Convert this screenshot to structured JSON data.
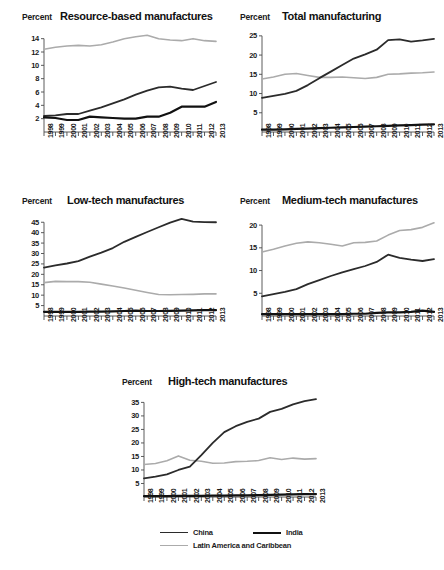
{
  "legend": {
    "items": [
      {
        "name": "China",
        "color": "#2b2b2b",
        "width": 1.9
      },
      {
        "name": "India",
        "color": "#111111",
        "width": 2.6
      },
      {
        "name": "Latin America and Caribbean",
        "color": "#ababab",
        "width": 1.7
      }
    ]
  },
  "axis_unit_label": "Percent",
  "chart_data": [
    {
      "type": "line",
      "title": "Resource-based manufactures",
      "xlabel": "",
      "ylabel": "Percent",
      "ylim": [
        0,
        15
      ],
      "yticks": [
        2,
        4,
        6,
        8,
        10,
        12,
        14
      ],
      "ytick_labels": [
        "2",
        "4",
        "6",
        "8",
        "10",
        "12",
        "14"
      ],
      "grid": false,
      "legend_position": "bottom",
      "categories": [
        "1998",
        "1999",
        "2000",
        "2001",
        "2002",
        "2003",
        "2004",
        "2005",
        "2006",
        "2007",
        "2008",
        "2009",
        "2010",
        "2011",
        "2012",
        "2013"
      ],
      "series": [
        {
          "name": "China",
          "color": "#2b2b2b",
          "values": [
            2.4,
            2.5,
            2.7,
            2.7,
            3.2,
            3.7,
            4.3,
            4.9,
            5.6,
            6.2,
            6.7,
            6.8,
            6.5,
            6.3,
            6.9,
            7.5
          ]
        },
        {
          "name": "India",
          "color": "#111111",
          "values": [
            2.2,
            2.1,
            1.8,
            1.8,
            2.3,
            2.2,
            2.1,
            2.0,
            2.0,
            2.3,
            2.3,
            2.9,
            3.8,
            3.8,
            3.8,
            4.5
          ]
        },
        {
          "name": "Latin America and Caribbean",
          "color": "#ababab",
          "values": [
            12.4,
            12.7,
            12.9,
            13.0,
            12.9,
            13.1,
            13.5,
            14.0,
            14.3,
            14.5,
            14.0,
            13.8,
            13.7,
            14.0,
            13.7,
            13.6
          ]
        }
      ]
    },
    {
      "type": "line",
      "title": "Total manufacturing",
      "xlabel": "",
      "ylabel": "Percent",
      "ylim": [
        0,
        26
      ],
      "yticks": [
        5,
        10,
        15,
        20,
        25
      ],
      "ytick_labels": [
        "5",
        "10",
        "15",
        "20",
        "25"
      ],
      "grid": false,
      "legend_position": "bottom",
      "categories": [
        "1998",
        "1999",
        "2000",
        "2001",
        "2002",
        "2003",
        "2004",
        "2005",
        "2006",
        "2007",
        "2008",
        "2009",
        "2010",
        "2011",
        "2012",
        "2013"
      ],
      "series": [
        {
          "name": "China",
          "color": "#2b2b2b",
          "values": [
            8.9,
            9.4,
            9.9,
            10.7,
            12.2,
            14.0,
            15.7,
            17.4,
            19.1,
            20.2,
            21.4,
            23.9,
            24.1,
            23.5,
            23.8,
            24.2
          ]
        },
        {
          "name": "India",
          "color": "#111111",
          "values": [
            0.6,
            0.6,
            0.7,
            0.8,
            0.9,
            1.0,
            1.1,
            1.2,
            1.3,
            1.4,
            1.5,
            1.6,
            1.7,
            1.8,
            1.9,
            2.0
          ]
        },
        {
          "name": "Latin America and Caribbean",
          "color": "#ababab",
          "values": [
            13.8,
            14.3,
            15.0,
            15.2,
            14.7,
            14.2,
            14.2,
            14.3,
            14.1,
            13.9,
            14.2,
            15.0,
            15.1,
            15.3,
            15.4,
            15.6
          ]
        }
      ]
    },
    {
      "type": "line",
      "title": "Low-tech manufactures",
      "xlabel": "",
      "ylabel": "Percent",
      "ylim": [
        0,
        48
      ],
      "yticks": [
        5,
        10,
        15,
        20,
        25,
        30,
        35,
        40,
        45
      ],
      "ytick_labels": [
        "5",
        "10",
        "15",
        "20",
        "25",
        "30",
        "35",
        "40",
        "45"
      ],
      "grid": false,
      "legend_position": "bottom",
      "categories": [
        "1998",
        "1999",
        "2000",
        "2001",
        "2002",
        "2003",
        "2004",
        "2005",
        "2006",
        "2007",
        "2008",
        "2009",
        "2010",
        "2011",
        "2012",
        "2013"
      ],
      "series": [
        {
          "name": "China",
          "color": "#2b2b2b",
          "values": [
            23.2,
            24.3,
            25.2,
            26.3,
            28.5,
            30.4,
            32.6,
            35.6,
            38.0,
            40.3,
            42.6,
            44.8,
            46.6,
            45.3,
            45.1,
            45.0
          ]
        },
        {
          "name": "India",
          "color": "#111111",
          "values": [
            2.0,
            2.0,
            2.0,
            2.0,
            2.1,
            2.1,
            2.2,
            2.4,
            2.6,
            2.4,
            2.4,
            2.5,
            2.6,
            2.7,
            2.8,
            2.8
          ]
        },
        {
          "name": "Latin America and Caribbean",
          "color": "#ababab",
          "values": [
            16.0,
            16.6,
            16.5,
            16.5,
            16.2,
            15.3,
            14.4,
            13.4,
            12.4,
            11.3,
            10.3,
            10.2,
            10.3,
            10.4,
            10.6,
            10.6
          ]
        }
      ]
    },
    {
      "type": "line",
      "title": "Medium-tech manufactures",
      "xlabel": "",
      "ylabel": "Percent",
      "ylim": [
        0,
        22
      ],
      "yticks": [
        5,
        10,
        15,
        20
      ],
      "ytick_labels": [
        "5",
        "10",
        "15",
        "20"
      ],
      "grid": false,
      "legend_position": "bottom",
      "categories": [
        "1998",
        "1999",
        "2000",
        "2001",
        "2002",
        "2003",
        "2004",
        "2005",
        "2006",
        "2007",
        "2008",
        "2009",
        "2010",
        "2011",
        "2012",
        "2013"
      ],
      "series": [
        {
          "name": "China",
          "color": "#2b2b2b",
          "values": [
            4.3,
            4.8,
            5.3,
            5.9,
            7.0,
            7.9,
            8.8,
            9.6,
            10.3,
            11.0,
            11.9,
            13.5,
            12.8,
            12.4,
            12.1,
            12.5
          ]
        },
        {
          "name": "India",
          "color": "#111111",
          "values": [
            0.4,
            0.4,
            0.4,
            0.4,
            0.4,
            0.4,
            0.4,
            0.4,
            0.5,
            0.5,
            0.7,
            0.8,
            0.8,
            0.9,
            1.2,
            0.9
          ]
        },
        {
          "name": "Latin America and Caribbean",
          "color": "#ababab",
          "values": [
            14.1,
            14.7,
            15.4,
            16.0,
            16.3,
            16.1,
            15.8,
            15.4,
            16.1,
            16.2,
            16.5,
            17.8,
            18.8,
            19.0,
            19.5,
            20.5
          ]
        }
      ]
    },
    {
      "type": "line",
      "title": "High-tech manufactures",
      "xlabel": "",
      "ylabel": "Percent",
      "ylim": [
        0,
        37
      ],
      "yticks": [
        5,
        10,
        15,
        20,
        25,
        30,
        35
      ],
      "ytick_labels": [
        "5",
        "10",
        "15",
        "20",
        "25",
        "30",
        "35"
      ],
      "grid": false,
      "legend_position": "bottom",
      "categories": [
        "1998",
        "1999",
        "2000",
        "2001",
        "2002",
        "2003",
        "2004",
        "2005",
        "2006",
        "2007",
        "2008",
        "2009",
        "2010",
        "2011",
        "2012",
        "2013"
      ],
      "series": [
        {
          "name": "China",
          "color": "#2b2b2b",
          "values": [
            6.9,
            7.5,
            8.4,
            10.0,
            11.2,
            15.5,
            20.0,
            24.0,
            26.2,
            27.8,
            29.0,
            31.5,
            32.6,
            34.3,
            35.5,
            36.2
          ]
        },
        {
          "name": "India",
          "color": "#111111",
          "values": [
            0.3,
            0.3,
            0.3,
            0.4,
            0.4,
            0.4,
            0.5,
            0.5,
            0.6,
            0.6,
            0.7,
            0.8,
            0.9,
            1.0,
            1.1,
            1.1
          ]
        },
        {
          "name": "Latin America and Caribbean",
          "color": "#ababab",
          "values": [
            12.0,
            12.4,
            13.4,
            15.2,
            13.6,
            13.2,
            12.5,
            12.6,
            13.1,
            13.2,
            13.5,
            14.5,
            13.9,
            14.4,
            14.0,
            14.2
          ]
        }
      ]
    }
  ]
}
